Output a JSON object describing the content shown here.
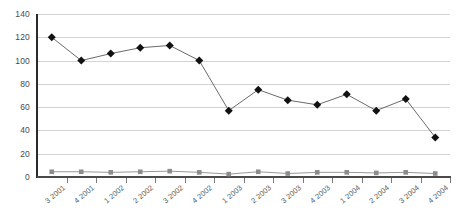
{
  "chart_data": {
    "type": "line",
    "title": "",
    "subtitle": "",
    "xlabel": "",
    "ylabel": "",
    "categories": [
      "3 2001",
      "4 2001",
      "1 2002",
      "2 2002",
      "3 2002",
      "4 2002",
      "1 2003",
      "2 2003",
      "3 2003",
      "4 2003",
      "1 2004",
      "2 2004",
      "3 2004",
      "4 2004"
    ],
    "ylim": [
      0,
      140
    ],
    "ytick_values": [
      0,
      20,
      40,
      60,
      80,
      100,
      120,
      140
    ],
    "ytick_labels": [
      "0",
      "20",
      "40",
      "60",
      "80",
      "100",
      "120",
      "140"
    ],
    "grid": true,
    "grid_axis": "y",
    "legend": false,
    "legend_position": "none",
    "series": [
      {
        "name": "series-1",
        "marker": "diamond",
        "color": "#111111",
        "line_color": "#595959",
        "values": [
          120,
          100,
          106,
          111,
          113,
          100,
          57,
          75,
          66,
          62,
          71,
          57,
          67,
          34
        ]
      },
      {
        "name": "series-2",
        "marker": "square",
        "color": "#8c8c8c",
        "line_color": "#8c8c8c",
        "values": [
          4.5,
          4.5,
          4,
          4.5,
          5,
          4,
          2.5,
          4.5,
          3,
          4,
          4,
          3.5,
          4,
          3
        ]
      }
    ],
    "colors": {
      "axis": "#2b2b2b",
      "grid": "#d4d4d4",
      "tick_text": "#4a4a4a",
      "background": "#ffffff"
    }
  }
}
